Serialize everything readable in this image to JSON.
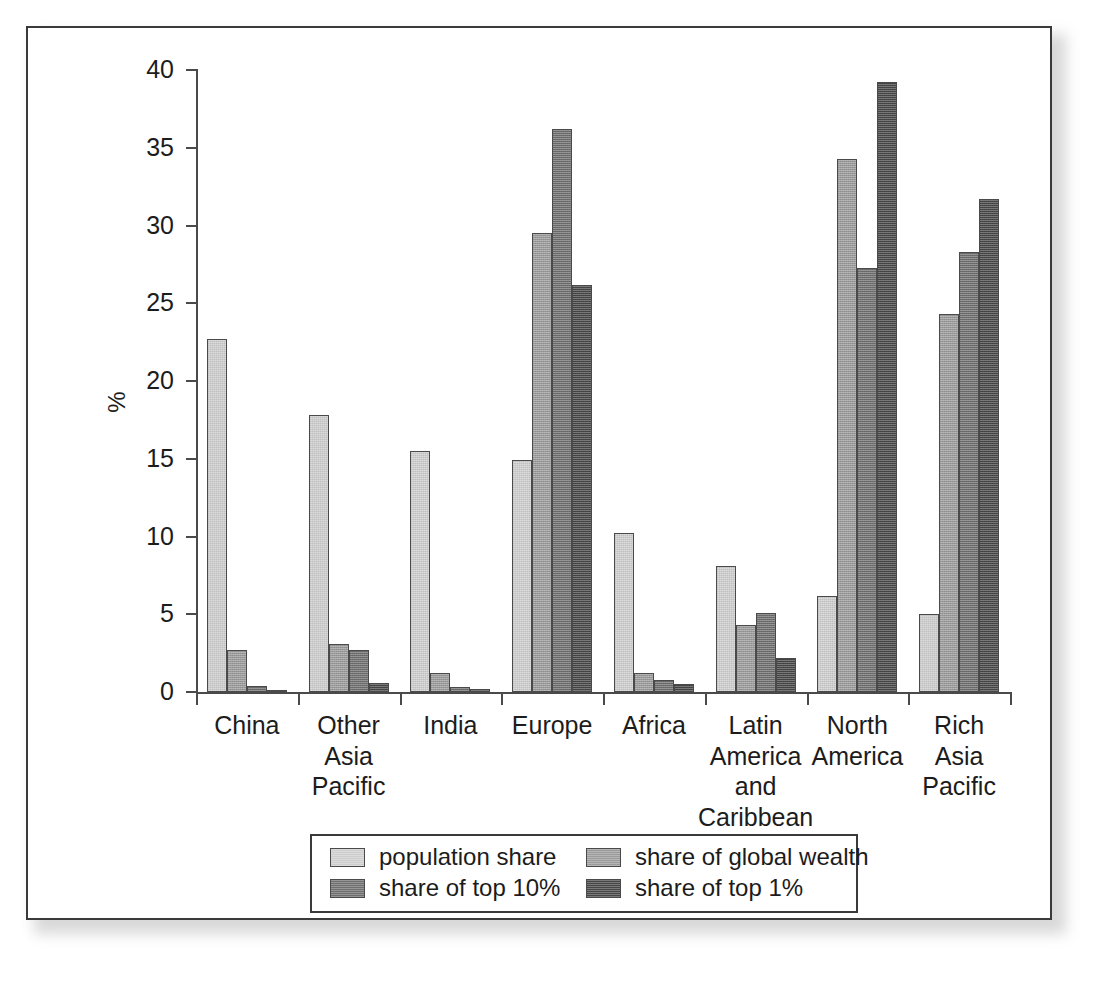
{
  "chart_data": {
    "type": "bar",
    "title": "",
    "subtitle": "",
    "xlabel": "",
    "ylabel": "%",
    "ylim": [
      0,
      40
    ],
    "yticks": [
      0,
      5,
      10,
      15,
      20,
      25,
      30,
      35,
      40
    ],
    "ytick_labels": [
      "0",
      "5",
      "10",
      "15",
      "20",
      "25",
      "30",
      "35",
      "40"
    ],
    "grid": false,
    "legend_position": "bottom-center",
    "categories": [
      "China",
      "Other\nAsia\nPacific",
      "India",
      "Europe",
      "Africa",
      "Latin\nAmerica\nand\nCaribbean",
      "North\nAmerica",
      "Rich\nAsia\nPacific"
    ],
    "series": [
      {
        "name": "population share",
        "color": "#cdcdcd",
        "values": [
          22.7,
          17.8,
          15.5,
          14.9,
          10.2,
          8.1,
          6.2,
          5.0
        ]
      },
      {
        "name": "share of global wealth",
        "color": "#9a9a9a",
        "values": [
          2.7,
          3.1,
          1.2,
          29.5,
          1.2,
          4.3,
          34.3,
          24.3
        ]
      },
      {
        "name": "share of top 10%",
        "color": "#6e6e6e",
        "values": [
          0.4,
          2.7,
          0.3,
          36.2,
          0.8,
          5.1,
          27.3,
          28.3
        ]
      },
      {
        "name": "share of top 1%",
        "color": "#464646",
        "values": [
          0.1,
          0.6,
          0.2,
          26.2,
          0.5,
          2.2,
          39.2,
          31.7
        ]
      }
    ]
  },
  "legend": {
    "entries": [
      {
        "label": "population share",
        "color": "#cdcdcd"
      },
      {
        "label": "share of global wealth",
        "color": "#9a9a9a"
      },
      {
        "label": "share of top 10%",
        "color": "#6e6e6e"
      },
      {
        "label": "share of top 1%",
        "color": "#464646"
      }
    ]
  },
  "caption": {
    "text": ""
  }
}
